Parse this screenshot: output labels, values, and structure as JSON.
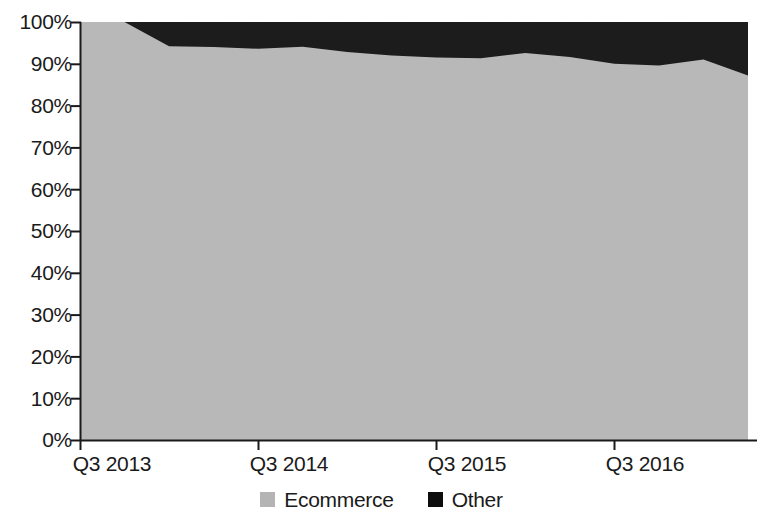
{
  "chart_data": {
    "type": "area",
    "stacked": true,
    "stack_total": 100,
    "title": "",
    "xlabel": "",
    "ylabel": "",
    "ylim": [
      0,
      100
    ],
    "y_unit": "%",
    "grid": false,
    "legend_position": "bottom",
    "y_ticks": [
      "0%",
      "10%",
      "20%",
      "30%",
      "40%",
      "50%",
      "60%",
      "70%",
      "80%",
      "90%",
      "100%"
    ],
    "y_tick_values": [
      0,
      10,
      20,
      30,
      40,
      50,
      60,
      70,
      80,
      90,
      100
    ],
    "x_ticks": [
      "Q3 2013",
      "Q3 2014",
      "Q3 2015",
      "Q3 2016"
    ],
    "x_tick_indices": [
      0,
      4,
      8,
      12
    ],
    "x": [
      "Q3 2013",
      "Q4 2013",
      "Q1 2014",
      "Q2 2014",
      "Q3 2014",
      "Q4 2014",
      "Q1 2015",
      "Q2 2015",
      "Q3 2015",
      "Q4 2015",
      "Q1 2016",
      "Q2 2016",
      "Q3 2016",
      "Q4 2016",
      "Q1 2017",
      "Q2 2017"
    ],
    "series": [
      {
        "name": "Ecommerce",
        "color": "#b4b4b4",
        "values": [
          100,
          100,
          94.2,
          94.0,
          93.6,
          94.1,
          92.8,
          92.0,
          91.5,
          91.3,
          92.6,
          91.6,
          90.0,
          89.6,
          91.0,
          87.2
        ]
      },
      {
        "name": "Other",
        "color": "#0d0d0d",
        "values": [
          0,
          0,
          5.8,
          6.0,
          6.4,
          5.9,
          7.2,
          8.0,
          8.5,
          8.7,
          7.4,
          8.4,
          10.0,
          10.4,
          9.0,
          12.8
        ]
      }
    ],
    "legend": [
      {
        "label": "Ecommerce",
        "color": "#b4b4b4"
      },
      {
        "label": "Other",
        "color": "#0d0d0d"
      }
    ],
    "axis_color": "#1a1a1a"
  }
}
